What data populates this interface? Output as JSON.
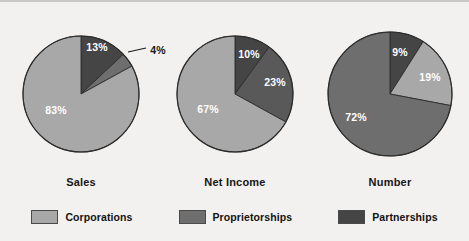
{
  "chart_data": {
    "type": "pie",
    "title": "",
    "xlabel": "",
    "ylabel": "",
    "legend_position": "bottom",
    "grid": false,
    "legend": [
      {
        "name": "Corporations",
        "color": "#a8a8a8"
      },
      {
        "name": "Proprietorships",
        "color": "#6e6e6e"
      },
      {
        "name": "Partnerships",
        "color": "#454545"
      }
    ],
    "charts": [
      {
        "label": "Sales",
        "center_x": 81,
        "center_y": 92,
        "radius": 58,
        "slices": [
          {
            "name": "Partnerships",
            "value": 13,
            "display": "13%",
            "color": "#454545",
            "label_color": "#ffffff",
            "label_outside": false,
            "label_x": 97,
            "label_y": 45
          },
          {
            "name": "Proprietorships",
            "value": 4,
            "display": "4%",
            "color": "#6e6e6e",
            "label_color": "#161616",
            "label_outside": true,
            "label_x": 158,
            "label_y": 48
          },
          {
            "name": "Corporations",
            "value": 83,
            "display": "83%",
            "color": "#a8a8a8",
            "label_color": "#ffffff",
            "label_outside": false,
            "label_x": 56,
            "label_y": 108
          }
        ]
      },
      {
        "label": "Net Income",
        "center_x": 235,
        "center_y": 92,
        "radius": 58,
        "slices": [
          {
            "name": "Partnerships",
            "value": 10,
            "display": "10%",
            "color": "#454545",
            "label_color": "#ffffff",
            "label_outside": false,
            "label_x": 249,
            "label_y": 52
          },
          {
            "name": "Proprietorships",
            "value": 23,
            "display": "23%",
            "color": "#595959",
            "label_color": "#ffffff",
            "label_outside": false,
            "label_x": 275,
            "label_y": 80
          },
          {
            "name": "Corporations",
            "value": 67,
            "display": "67%",
            "color": "#a8a8a8",
            "label_color": "#ffffff",
            "label_outside": false,
            "label_x": 208,
            "label_y": 107
          }
        ]
      },
      {
        "label": "Number",
        "center_x": 390,
        "center_y": 92,
        "radius": 62,
        "slices": [
          {
            "name": "Partnerships",
            "value": 9,
            "display": "9%",
            "color": "#454545",
            "label_color": "#ffffff",
            "label_outside": false,
            "label_x": 400,
            "label_y": 50
          },
          {
            "name": "Corporations",
            "value": 19,
            "display": "19%",
            "color": "#a8a8a8",
            "label_color": "#ffffff",
            "label_outside": false,
            "label_x": 430,
            "label_y": 75
          },
          {
            "name": "Proprietorships",
            "value": 72,
            "display": "72%",
            "color": "#6e6e6e",
            "label_color": "#ffffff",
            "label_outside": false,
            "label_x": 356,
            "label_y": 115
          }
        ]
      }
    ],
    "category_labels": [
      {
        "text": "Sales",
        "x": 81,
        "y": 180
      },
      {
        "text": "Net Income",
        "x": 235,
        "y": 180
      },
      {
        "text": "Number",
        "x": 390,
        "y": 180
      }
    ],
    "leader_line": {
      "x1": 128,
      "y1": 50,
      "x2": 146,
      "y2": 46
    }
  }
}
